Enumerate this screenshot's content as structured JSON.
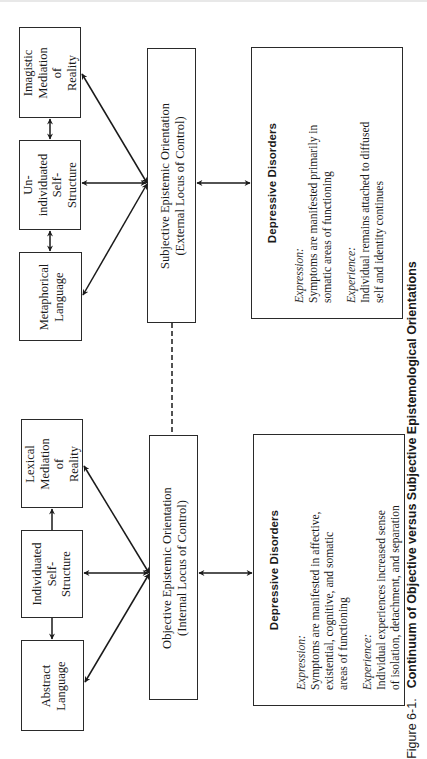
{
  "figure": {
    "number": "Figure 6-1.",
    "title": "Continuum of Objective versus Subjective Epistemological Orientations"
  },
  "subjective": {
    "mediation": {
      "lines": [
        "Imagistic",
        "Mediation",
        "of",
        "Reality"
      ]
    },
    "self_structure": {
      "lines": [
        "Un-",
        "individuated",
        "Self-",
        "Structure"
      ]
    },
    "language": {
      "lines": [
        "Metaphorical",
        "Language"
      ]
    },
    "orientation": {
      "lines": [
        "Subjective Epistemic Orientation",
        "(External Locus of Control)"
      ]
    },
    "disorders": {
      "title": "Depressive Disorders",
      "expression_label": "Expression:",
      "expression_lines": [
        "Symptoms are manifested primarily in",
        "somatic areas of functioning"
      ],
      "experience_label": "Experience:",
      "experience_lines": [
        "Individual remains attached to diffused",
        "self and identity continues"
      ]
    }
  },
  "objective": {
    "mediation": {
      "lines": [
        "Lexical",
        "Mediation",
        "of",
        "Reality"
      ]
    },
    "self_structure": {
      "lines": [
        "Individuated",
        "Self-",
        "Structure"
      ]
    },
    "language": {
      "lines": [
        "Abstract",
        "Language"
      ]
    },
    "orientation": {
      "lines": [
        "Objective Epistemic Orientation",
        "(Internal Locus of Control)"
      ]
    },
    "disorders": {
      "title": "Depressive Disorders",
      "expression_label": "Expression:",
      "expression_lines": [
        "Symptoms are manifested in affective,",
        "existential, cognitive, and somatic",
        "areas of functioning"
      ],
      "experience_label": "Experience:",
      "experience_lines": [
        "Individual experiences increased sense",
        "of isolation, detachment, and separation"
      ]
    }
  },
  "connectors": {
    "continuum_link": "dashed",
    "stroke_color": "#1a1a1a"
  }
}
